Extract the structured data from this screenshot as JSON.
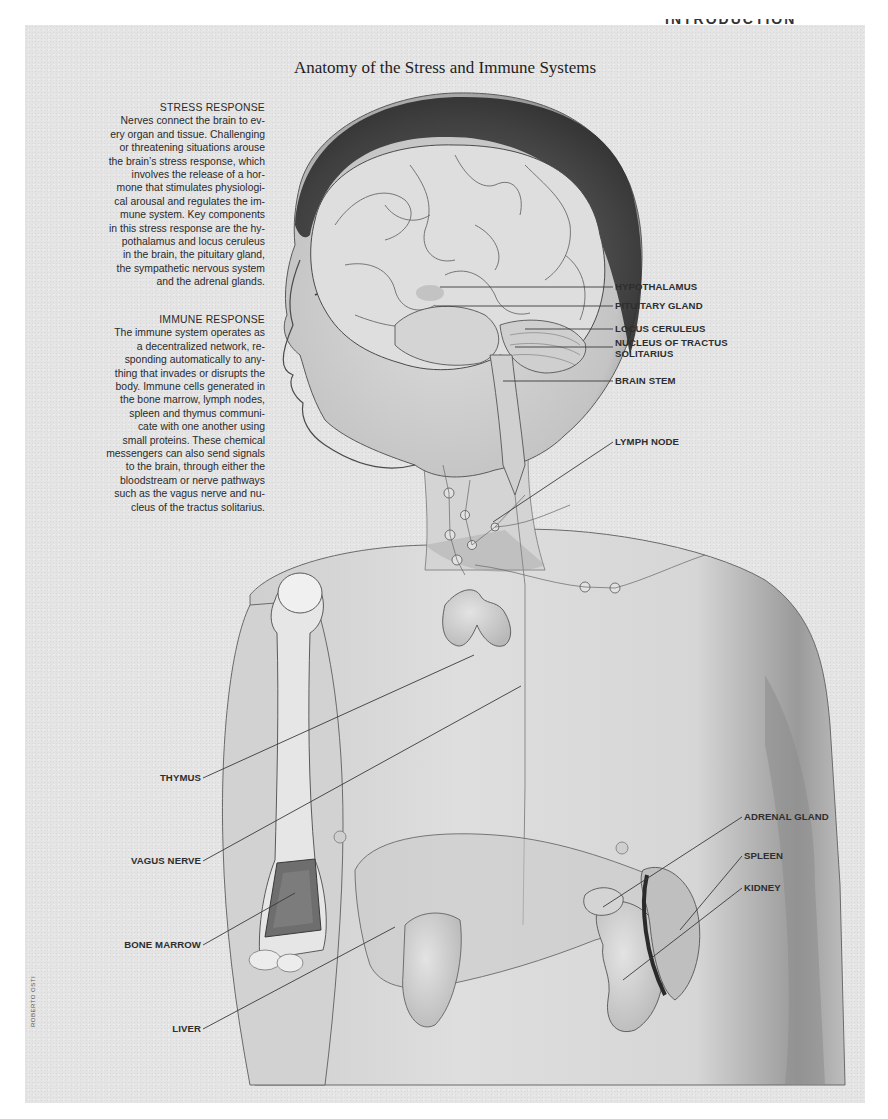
{
  "page": {
    "running_head": "INTRODUCTION",
    "title": "Anatomy of the Stress and Immune Systems",
    "credit": "ROBERTO OSTI"
  },
  "sidebar": {
    "stress": {
      "heading": "STRESS RESPONSE",
      "lines": [
        "Nerves connect the brain to ev-",
        "ery organ and tissue. Challenging",
        "or threatening situations arouse",
        "the brain’s stress response, which",
        "involves the release of a hor-",
        "mone that stimulates physiologi-",
        "cal arousal and regulates the im-",
        "mune system. Key components",
        "in this stress response are the hy-",
        "pothalamus and locus ceruleus",
        "in the brain, the pituitary gland,",
        "the sympathetic nervous system",
        "and the adrenal glands."
      ]
    },
    "immune": {
      "heading": "IMMUNE RESPONSE",
      "lines": [
        "The immune system operates as",
        "a decentralized network, re-",
        "sponding automatically to any-",
        "thing that invades or disrupts the",
        "body. Immune cells generated in",
        "the bone marrow, lymph nodes,",
        "spleen and thymus communi-",
        "cate with one another using",
        "small proteins. These chemical",
        "messengers can also send signals",
        "to the brain, through either the",
        "bloodstream or nerve pathways",
        "such as the vagus nerve and nu-",
        "cleus of the tractus solitarius."
      ]
    }
  },
  "labels": {
    "hypothalamus": "HYPOTHALAMUS",
    "pituitary": "PITUITARY GLAND",
    "locus": "LOCUS CERULEUS",
    "nucleus_1": "NUCLEUS OF TRACTUS",
    "nucleus_2": "SOLITARIUS",
    "brain_stem": "BRAIN STEM",
    "lymph_node": "LYMPH NODE",
    "thymus": "THYMUS",
    "vagus": "VAGUS NERVE",
    "bone_marrow": "BONE MARROW",
    "liver": "LIVER",
    "adrenal": "ADRENAL GLAND",
    "spleen": "SPLEEN",
    "kidney": "KIDNEY"
  },
  "colors": {
    "panel_bg": "#e4e4e4",
    "ink": "#2a2a2a",
    "skin": "#d8d8d8",
    "organ": "#c9c9c9",
    "shadow": "#8a8a8a"
  }
}
